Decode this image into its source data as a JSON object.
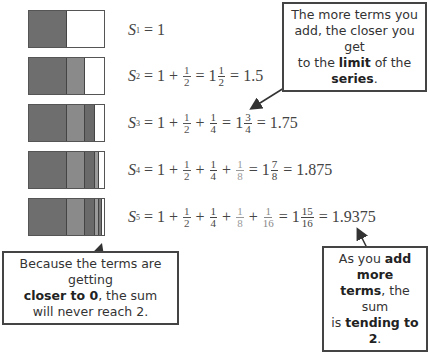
{
  "bars": [
    {
      "label": "S1",
      "segments": [
        {
          "frac": 0.5,
          "color": "#6e6e6e"
        }
      ]
    },
    {
      "label": "S2",
      "segments": [
        {
          "frac": 0.5,
          "color": "#6e6e6e"
        },
        {
          "frac": 0.25,
          "color": "#8a8a8a"
        }
      ]
    },
    {
      "label": "S3",
      "segments": [
        {
          "frac": 0.5,
          "color": "#6e6e6e"
        },
        {
          "frac": 0.25,
          "color": "#8a8a8a"
        },
        {
          "frac": 0.125,
          "color": "#6a6a6a"
        }
      ]
    },
    {
      "label": "S4",
      "segments": [
        {
          "frac": 0.5,
          "color": "#6e6e6e"
        },
        {
          "frac": 0.25,
          "color": "#8a8a8a"
        },
        {
          "frac": 0.125,
          "color": "#6a6a6a"
        },
        {
          "frac": 0.0625,
          "color": "#9a9a9a"
        }
      ]
    },
    {
      "label": "S5",
      "segments": [
        {
          "frac": 0.5,
          "color": "#6e6e6e"
        },
        {
          "frac": 0.25,
          "color": "#8a8a8a"
        },
        {
          "frac": 0.125,
          "color": "#6a6a6a"
        },
        {
          "frac": 0.0625,
          "color": "#9a9a9a"
        },
        {
          "frac": 0.03125,
          "color": "#777777"
        }
      ]
    }
  ],
  "equations": {
    "s1": {
      "S": "S",
      "sub": "1",
      "eq": "=",
      "one": "1"
    },
    "s2": {
      "S": "S",
      "sub": "2",
      "eq": "=",
      "one": "1",
      "plus": "+",
      "n": "1",
      "d2": "2",
      "mixed_whole": "1",
      "mixed_n": "1",
      "mixed_d": "2",
      "decimal": "1.5"
    },
    "s3": {
      "S": "S",
      "sub": "3",
      "eq": "=",
      "one": "1",
      "plus": "+",
      "n": "1",
      "d2": "2",
      "d4": "4",
      "mixed_whole": "1",
      "mixed_n": "3",
      "mixed_d": "4",
      "decimal": "1.75"
    },
    "s4": {
      "S": "S",
      "sub": "4",
      "eq": "=",
      "one": "1",
      "plus": "+",
      "n": "1",
      "d2": "2",
      "d4": "4",
      "d8": "8",
      "mixed_whole": "1",
      "mixed_n": "7",
      "mixed_d": "8",
      "decimal": "1.875"
    },
    "s5": {
      "S": "S",
      "sub": "5",
      "eq": "=",
      "one": "1",
      "plus": "+",
      "n": "1",
      "d2": "2",
      "d4": "4",
      "d8": "8",
      "d16": "16",
      "mixed_whole": "1",
      "mixed_n": "15",
      "mixed_d": "16",
      "decimal": "1.9375"
    }
  },
  "notes": {
    "top": {
      "l1": "The more terms you",
      "l2": "add, the closer you get",
      "l3a": "to the ",
      "l3b": "limit",
      "l3c": " of the ",
      "l3d": "series",
      "l3e": "."
    },
    "bottom_left": {
      "l1": "Because the terms are getting",
      "l2a": "closer to 0",
      "l2b": ", the sum",
      "l3": "will never reach 2."
    },
    "bottom_right": {
      "l1a": "As you ",
      "l1b": "add more",
      "l2a": "terms",
      "l2b": ", the sum",
      "l3a": "is ",
      "l3b": "tending to 2",
      "l3c": "."
    }
  }
}
